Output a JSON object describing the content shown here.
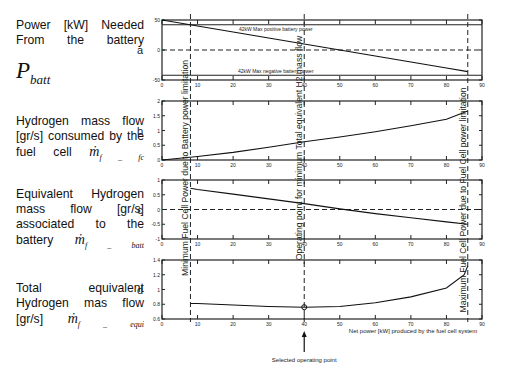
{
  "descriptions": {
    "a": {
      "text": "Power [kW] Needed From the battery",
      "symbol": "P",
      "sub": "batt"
    },
    "b": {
      "text": "Hydrogen mass flow [gr/s] consumed by the fuel cell",
      "symbol": "ṁ",
      "sub": "f _ fc"
    },
    "c": {
      "text": "Equivalent Hydrogen mass flow [gr/s] associated to the battery",
      "symbol": "ṁ",
      "sub": "f _ batt"
    },
    "d": {
      "text": "Total equivalent Hydrogen mas flow [gr/s]",
      "symbol": "ṁ",
      "sub": "f _ equi"
    }
  },
  "annotations": {
    "max_pos": "42kW Max positive battery power",
    "max_neg": "42kW Max negative battery power",
    "min_fc": "Minimum Fuel Cell Power due to Battery power limitation",
    "op_point": "Operating point for minimum Total equivalent H2 mass flow",
    "max_fc": "Maximum Fuel Cell Power due to Fuel Cell power limitation",
    "selected": "Selected operating point",
    "xlabel": "Net power [kW] produced by the fuel cell system"
  },
  "chart_data": [
    {
      "type": "line",
      "panel": "a",
      "title": "Power [kW] Needed From the battery",
      "xlabel": "Net power [kW] produced by the fuel cell system",
      "ylabel": "a",
      "xlim": [
        0,
        90
      ],
      "ylim": [
        -50,
        50
      ],
      "xticks": [
        0,
        10,
        20,
        30,
        40,
        50,
        60,
        70,
        80,
        90
      ],
      "yticks": [
        -50,
        0,
        50
      ],
      "series": [
        {
          "name": "P_batt",
          "x": [
            0,
            10,
            20,
            30,
            40,
            50,
            60,
            70,
            80,
            86
          ],
          "y": [
            50,
            40,
            30,
            20,
            10,
            0,
            -10,
            -20,
            -30,
            -36
          ]
        }
      ],
      "hlines": [
        {
          "y": 42,
          "label": "42kW Max positive battery power"
        },
        {
          "y": -42,
          "label": "42kW Max negative battery power"
        },
        {
          "y": 0,
          "style": "dashed"
        }
      ]
    },
    {
      "type": "line",
      "panel": "b",
      "title": "Hydrogen mass flow [gr/s] consumed by the fuel cell",
      "xlim": [
        0,
        90
      ],
      "ylim": [
        0,
        2
      ],
      "ylabel": "b",
      "xticks": [
        0,
        10,
        20,
        30,
        40,
        50,
        60,
        70,
        80,
        90
      ],
      "yticks": [
        0,
        0.5,
        1,
        1.5,
        2
      ],
      "series": [
        {
          "name": "m_f_fc",
          "x": [
            0,
            10,
            20,
            30,
            40,
            50,
            60,
            70,
            80,
            86
          ],
          "y": [
            0,
            0.12,
            0.26,
            0.43,
            0.62,
            0.78,
            0.96,
            1.16,
            1.38,
            1.66
          ]
        }
      ]
    },
    {
      "type": "line",
      "panel": "c",
      "title": "Equivalent Hydrogen mass flow [gr/s] associated to the battery",
      "xlim": [
        0,
        90
      ],
      "ylim": [
        -1,
        1
      ],
      "ylabel": "c",
      "xticks": [
        0,
        10,
        20,
        30,
        40,
        50,
        60,
        70,
        80,
        90
      ],
      "yticks": [
        -1,
        -0.5,
        0,
        0.5,
        1
      ],
      "series": [
        {
          "name": "m_f_batt",
          "x": [
            8,
            10,
            20,
            30,
            40,
            50,
            60,
            70,
            80,
            86
          ],
          "y": [
            0.72,
            0.68,
            0.52,
            0.36,
            0.2,
            0.02,
            -0.14,
            -0.28,
            -0.42,
            -0.5
          ]
        }
      ]
    },
    {
      "type": "line",
      "panel": "d",
      "title": "Total equivalent Hydrogen mas flow [gr/s]",
      "xlim": [
        0,
        90
      ],
      "ylim": [
        0.6,
        1.4
      ],
      "ylabel": "d",
      "xticks": [
        0,
        10,
        20,
        30,
        40,
        50,
        60,
        70,
        80,
        90
      ],
      "yticks": [
        0.6,
        0.8,
        1,
        1.2,
        1.4
      ],
      "series": [
        {
          "name": "m_f_equi",
          "x": [
            8,
            10,
            20,
            30,
            40,
            50,
            60,
            70,
            80,
            85,
            86
          ],
          "y": [
            0.81,
            0.81,
            0.79,
            0.77,
            0.76,
            0.77,
            0.82,
            0.9,
            1.02,
            1.2,
            1.32
          ]
        }
      ],
      "vlines": [
        {
          "x": 8,
          "label": "Minimum Fuel Cell Power due to Battery power limitation"
        },
        {
          "x": 40,
          "label": "Operating point for minimum Total equivalent H2 mass flow"
        },
        {
          "x": 86,
          "label": "Maximum Fuel Cell Power due to Fuel Cell power limitation"
        }
      ],
      "marker": {
        "x": 40,
        "y": 0.76,
        "label": "Selected operating point"
      }
    }
  ]
}
